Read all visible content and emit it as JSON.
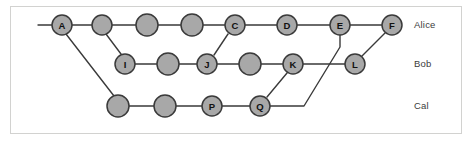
{
  "figure": {
    "background_color": "#ffffff",
    "frame_color": "#d2d2d0",
    "node_fill": "#a8a8a8",
    "node_stroke": "#3a3a3a",
    "edge_color": "#3a3a3a",
    "label_color": "#3b3b3b"
  },
  "lanes": [
    {
      "name": "alice",
      "label": "Alice",
      "y": 25,
      "label_x": 414,
      "label_y": 25
    },
    {
      "name": "bob",
      "label": "Bob",
      "y": 64,
      "label_x": 414,
      "label_y": 64
    },
    {
      "name": "cal",
      "label": "Cal",
      "y": 106,
      "label_x": 414,
      "label_y": 106
    }
  ],
  "nodes": [
    {
      "id": "a",
      "label": "A",
      "lane": "alice",
      "x": 62,
      "y": 25,
      "r": 10
    },
    {
      "id": "alice2",
      "label": "",
      "lane": "alice",
      "x": 102,
      "y": 25,
      "r": 10
    },
    {
      "id": "alice3",
      "label": "",
      "lane": "alice",
      "x": 147,
      "y": 25,
      "r": 11
    },
    {
      "id": "alice4",
      "label": "",
      "lane": "alice",
      "x": 192,
      "y": 25,
      "r": 11
    },
    {
      "id": "c",
      "label": "C",
      "lane": "alice",
      "x": 235,
      "y": 25,
      "r": 10
    },
    {
      "id": "d",
      "label": "D",
      "lane": "alice",
      "x": 287,
      "y": 25,
      "r": 10
    },
    {
      "id": "e",
      "label": "E",
      "lane": "alice",
      "x": 340,
      "y": 25,
      "r": 10
    },
    {
      "id": "f",
      "label": "F",
      "lane": "alice",
      "x": 392,
      "y": 25,
      "r": 10
    },
    {
      "id": "i",
      "label": "I",
      "lane": "bob",
      "x": 125,
      "y": 64,
      "r": 10
    },
    {
      "id": "bob2",
      "label": "",
      "lane": "bob",
      "x": 168,
      "y": 64,
      "r": 11
    },
    {
      "id": "j",
      "label": "J",
      "lane": "bob",
      "x": 207,
      "y": 64,
      "r": 10
    },
    {
      "id": "bob4",
      "label": "",
      "lane": "bob",
      "x": 250,
      "y": 64,
      "r": 11
    },
    {
      "id": "k",
      "label": "K",
      "lane": "bob",
      "x": 293,
      "y": 64,
      "r": 10
    },
    {
      "id": "l",
      "label": "L",
      "lane": "bob",
      "x": 355,
      "y": 64,
      "r": 10
    },
    {
      "id": "cal1",
      "label": "",
      "lane": "cal",
      "x": 118,
      "y": 106,
      "r": 11
    },
    {
      "id": "cal2",
      "label": "",
      "lane": "cal",
      "x": 165,
      "y": 106,
      "r": 11
    },
    {
      "id": "p",
      "label": "P",
      "lane": "cal",
      "x": 212,
      "y": 106,
      "r": 10
    },
    {
      "id": "q",
      "label": "Q",
      "lane": "cal",
      "x": 260,
      "y": 106,
      "r": 10
    }
  ],
  "labelled_node_ids": [
    "a",
    "c",
    "d",
    "e",
    "f",
    "i",
    "j",
    "k",
    "l",
    "p",
    "q"
  ],
  "edges": [
    {
      "name": "stub-into-a",
      "points": "38,25 52,25"
    },
    {
      "name": "a-to-alice2",
      "points": "72,25 92,25"
    },
    {
      "name": "alice2-to-alice3",
      "points": "112,25 136,25"
    },
    {
      "name": "alice3-to-alice4",
      "points": "158,25 181,25"
    },
    {
      "name": "alice4-to-c",
      "points": "203,25 225,25"
    },
    {
      "name": "c-to-d",
      "points": "245,25 277,25"
    },
    {
      "name": "d-to-e",
      "points": "297,25 330,25"
    },
    {
      "name": "e-to-f",
      "points": "350,25 382,25"
    },
    {
      "name": "i-to-bob2",
      "points": "135,64 157,64"
    },
    {
      "name": "bob2-to-j",
      "points": "179,64 197,64"
    },
    {
      "name": "j-to-bob4",
      "points": "217,64 239,64"
    },
    {
      "name": "bob4-to-k",
      "points": "261,64 283,64"
    },
    {
      "name": "k-to-l",
      "points": "303,64 345,64"
    },
    {
      "name": "cal1-to-cal2",
      "points": "129,106 154,106"
    },
    {
      "name": "cal2-to-p",
      "points": "176,106 202,106"
    },
    {
      "name": "p-to-q",
      "points": "222,106 250,106"
    },
    {
      "name": "a-to-cal1",
      "points": "66,34 114,96"
    },
    {
      "name": "b-to-i",
      "points": "106,34 121,54"
    },
    {
      "name": "j-to-c",
      "points": "214,55 228,34"
    },
    {
      "name": "q-to-k",
      "points": "267,97 287,73"
    },
    {
      "name": "l-to-f",
      "points": "362,56 385,33"
    },
    {
      "name": "q-to-e",
      "points": "270,106 304,106 340,47 340,35"
    }
  ]
}
